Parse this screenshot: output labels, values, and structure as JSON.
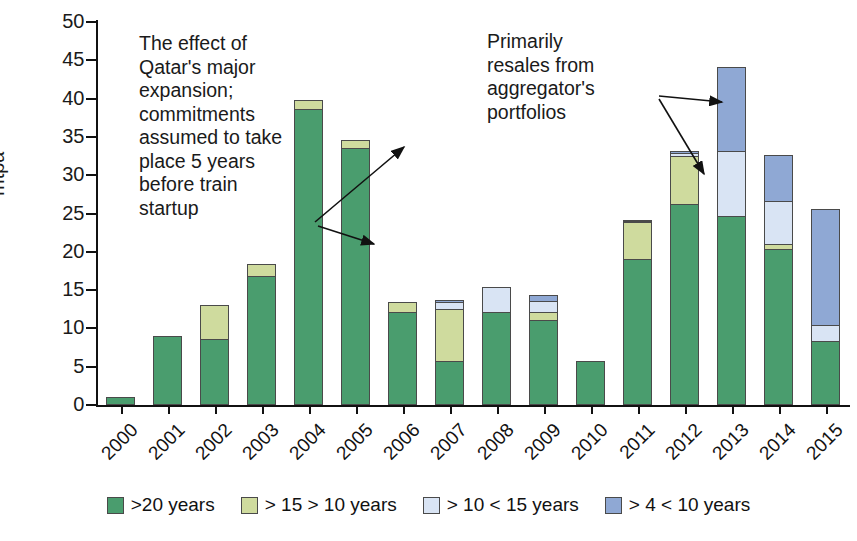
{
  "chart_data": {
    "type": "bar",
    "stacked": true,
    "title": "",
    "xlabel": "",
    "ylabel": "mtpa",
    "ylim": [
      0,
      50
    ],
    "ytick_step": 5,
    "yticks": [
      0,
      5,
      10,
      15,
      20,
      25,
      30,
      35,
      40,
      45,
      50
    ],
    "grid": false,
    "legend_position": "bottom",
    "categories": [
      "2000",
      "2001",
      "2002",
      "2003",
      "2004",
      "2005",
      "2006",
      "2007",
      "2008",
      "2009",
      "2010",
      "2011",
      "2012",
      "2013",
      "2014",
      "2015"
    ],
    "series": [
      {
        "name": ">20 years",
        "color": "#4a9d6e",
        "values": [
          1.0,
          9.0,
          8.6,
          16.8,
          38.6,
          33.6,
          12.1,
          5.7,
          12.1,
          11.1,
          5.7,
          19.0,
          26.2,
          24.7,
          20.4,
          8.4
        ]
      },
      {
        "name": "> 15 > 10 years",
        "color": "#cfdb9e",
        "values": [
          0.0,
          0.0,
          4.6,
          1.8,
          1.4,
          1.1,
          1.5,
          7.0,
          0.0,
          1.2,
          0.0,
          5.0,
          6.5,
          0.0,
          0.8,
          0.0
        ]
      },
      {
        "name": "> 10 < 15  years",
        "color": "#d9e4f4",
        "values": [
          0.0,
          0.0,
          0.0,
          0.0,
          0.0,
          0.0,
          0.0,
          1.0,
          3.4,
          1.6,
          0.0,
          0.3,
          0.4,
          8.6,
          5.7,
          2.2
        ]
      },
      {
        "name": "> 4 < 10 years",
        "color": "#8fa8d4",
        "values": [
          0.0,
          0.0,
          0.0,
          0.0,
          0.0,
          0.0,
          0.0,
          0.4,
          0.0,
          0.9,
          0.0,
          0.3,
          0.4,
          11.1,
          6.1,
          15.2
        ]
      }
    ],
    "totals": [
      1.0,
      9.0,
      13.2,
      18.6,
      40.0,
      34.7,
      13.6,
      14.1,
      15.5,
      14.8,
      5.7,
      24.6,
      33.5,
      44.4,
      33.0,
      25.8
    ],
    "annotations": [
      {
        "id": "qatar",
        "text": "The effect of Qatar's major expansion; commitments assumed to take place 5 years before train startup"
      },
      {
        "id": "resale",
        "text": "Primarily resales from aggregator's portfolios"
      }
    ]
  },
  "axis": {
    "y_label": "mtpa",
    "y_ticks": [
      "50",
      "45",
      "40",
      "35",
      "30",
      "25",
      "20",
      "15",
      "10",
      "5",
      "0"
    ],
    "x_ticks": [
      "2000",
      "2001",
      "2002",
      "2003",
      "2004",
      "2005",
      "2006",
      "2007",
      "2008",
      "2009",
      "2010",
      "2011",
      "2012",
      "2013",
      "2014",
      "2015"
    ]
  },
  "legend": {
    "items": [
      {
        "label": ">20 years",
        "color": "#4a9d6e"
      },
      {
        "label": "> 15 > 10 years",
        "color": "#cfdb9e"
      },
      {
        "label": "> 10 < 15  years",
        "color": "#d9e4f4"
      },
      {
        "label": "> 4 < 10 years",
        "color": "#8fa8d4"
      }
    ]
  },
  "annotations": {
    "qatar": "The effect of\nQatar's major\nexpansion;\ncommitments\nassumed to take\nplace 5 years\nbefore train\nstartup",
    "resale": "Primarily\nresales from\naggregator's\nportfolios"
  }
}
